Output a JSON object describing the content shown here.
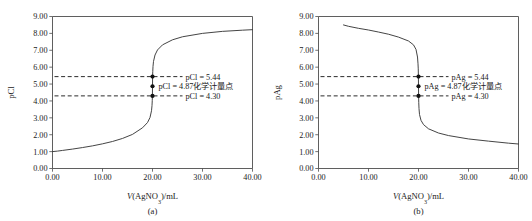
{
  "figure": {
    "panels": [
      {
        "caption": "(a)",
        "species": "pCl",
        "ylabel": "pCl",
        "xlabel_prefix": "V",
        "xlabel_body": "(AgNO",
        "xlabel_sub": "3",
        "xlabel_suffix": ")/mL",
        "annotations": [
          {
            "name": "upper",
            "text": "pCl = 5.44",
            "value": 5.44,
            "x_mL": 20.0
          },
          {
            "name": "equivalence",
            "text": "pCl = 4.87化学计量点",
            "value": 4.87,
            "x_mL": 20.0
          },
          {
            "name": "lower",
            "text": "pCl = 4.30",
            "value": 4.3,
            "x_mL": 20.0
          }
        ]
      },
      {
        "caption": "(b)",
        "species": "pAg",
        "ylabel": "pAg",
        "xlabel_prefix": "V",
        "xlabel_body": "(AgNO",
        "xlabel_sub": "3",
        "xlabel_suffix": ")/mL",
        "annotations": [
          {
            "name": "upper",
            "text": "pAg = 5.44",
            "value": 5.44,
            "x_mL": 20.0
          },
          {
            "name": "equivalence",
            "text": "pAg = 4.87化学计量点",
            "value": 4.87,
            "x_mL": 20.0
          },
          {
            "name": "lower",
            "text": "pAg = 4.30",
            "value": 4.3,
            "x_mL": 20.0
          }
        ]
      }
    ]
  },
  "chart_data": [
    {
      "type": "line",
      "title": "",
      "panel_caption": "(a)",
      "xlabel": "V(AgNO3)/mL",
      "ylabel": "pCl",
      "xlim": [
        0.0,
        40.0
      ],
      "ylim": [
        0.0,
        9.0
      ],
      "xticks": [
        0.0,
        10.0,
        20.0,
        30.0,
        40.0
      ],
      "xtick_labels": [
        "0.00",
        "10.00",
        "20.00",
        "30.00",
        "40.00"
      ],
      "yticks": [
        0.0,
        1.0,
        2.0,
        3.0,
        4.0,
        5.0,
        6.0,
        7.0,
        8.0,
        9.0
      ],
      "ytick_labels": [
        "0.00",
        "1.00",
        "2.00",
        "3.00",
        "4.00",
        "5.00",
        "6.00",
        "7.00",
        "8.00",
        "9.00"
      ],
      "grid": false,
      "legend": "none",
      "series": [
        {
          "name": "pCl titration curve",
          "x": [
            0.0,
            1.0,
            2.0,
            4.0,
            6.0,
            8.0,
            10.0,
            12.0,
            14.0,
            16.0,
            18.0,
            19.0,
            19.5,
            19.8,
            19.9,
            19.95,
            19.98,
            20.0,
            20.02,
            20.05,
            20.1,
            20.2,
            20.5,
            21.0,
            22.0,
            24.0,
            26.0,
            30.0,
            34.0,
            38.0,
            40.0
          ],
          "y": [
            1.0,
            1.03,
            1.07,
            1.15,
            1.24,
            1.34,
            1.46,
            1.6,
            1.78,
            2.02,
            2.41,
            2.72,
            3.02,
            3.42,
            3.72,
            4.02,
            4.3,
            4.87,
            5.44,
            5.74,
            6.04,
            6.34,
            6.72,
            7.02,
            7.32,
            7.62,
            7.8,
            8.0,
            8.12,
            8.19,
            8.22
          ]
        }
      ],
      "reference_lines": [
        {
          "label": "pCl = 5.44",
          "y": 5.44,
          "style": "dashed",
          "marker_x": 20.0
        },
        {
          "label": "pCl = 4.30",
          "y": 4.3,
          "style": "dashed",
          "marker_x": 20.0
        }
      ],
      "markers": [
        {
          "label": "pCl = 5.44",
          "x": 20.0,
          "y": 5.44
        },
        {
          "label": "pCl = 4.87化学计量点",
          "x": 20.0,
          "y": 4.87
        },
        {
          "label": "pCl = 4.30",
          "x": 20.0,
          "y": 4.3
        }
      ]
    },
    {
      "type": "line",
      "title": "",
      "panel_caption": "(b)",
      "xlabel": "V(AgNO3)/mL",
      "ylabel": "pAg",
      "xlim": [
        0.0,
        40.0
      ],
      "ylim": [
        0.0,
        9.0
      ],
      "xticks": [
        0.0,
        10.0,
        20.0,
        30.0,
        40.0
      ],
      "xtick_labels": [
        "0.00",
        "10.00",
        "20.00",
        "30.00",
        "40.00"
      ],
      "yticks": [
        0.0,
        1.0,
        2.0,
        3.0,
        4.0,
        5.0,
        6.0,
        7.0,
        8.0,
        9.0
      ],
      "ytick_labels": [
        "0.00",
        "1.00",
        "2.00",
        "3.00",
        "4.00",
        "5.00",
        "6.00",
        "7.00",
        "8.00",
        "9.00"
      ],
      "grid": false,
      "legend": "none",
      "series": [
        {
          "name": "pAg titration curve",
          "x": [
            5.0,
            6.0,
            8.0,
            10.0,
            12.0,
            14.0,
            16.0,
            18.0,
            19.0,
            19.5,
            19.8,
            19.9,
            19.95,
            19.98,
            20.0,
            20.02,
            20.05,
            20.1,
            20.2,
            20.5,
            21.0,
            22.0,
            24.0,
            26.0,
            30.0,
            34.0,
            38.0,
            40.0
          ],
          "y": [
            8.5,
            8.42,
            8.3,
            8.2,
            8.08,
            7.95,
            7.78,
            7.55,
            7.32,
            7.05,
            6.6,
            6.2,
            5.9,
            5.44,
            4.87,
            4.3,
            3.9,
            3.55,
            3.2,
            2.85,
            2.6,
            2.35,
            2.1,
            1.95,
            1.75,
            1.62,
            1.5,
            1.45
          ]
        }
      ],
      "reference_lines": [
        {
          "label": "pAg = 5.44",
          "y": 5.44,
          "style": "dashed",
          "marker_x": 20.0
        },
        {
          "label": "pAg = 4.30",
          "y": 4.3,
          "style": "dashed",
          "marker_x": 20.0
        }
      ],
      "markers": [
        {
          "label": "pAg = 5.44",
          "x": 20.0,
          "y": 5.44
        },
        {
          "label": "pAg = 4.87化学计量点",
          "x": 20.0,
          "y": 4.87
        },
        {
          "label": "pAg = 4.30",
          "x": 20.0,
          "y": 4.3
        }
      ]
    }
  ],
  "colors": {
    "background": "#ffffff",
    "curve": "#3a3a3a",
    "axis": "#4d4d4d",
    "text": "#1a1a1a",
    "marker": "#121212"
  }
}
